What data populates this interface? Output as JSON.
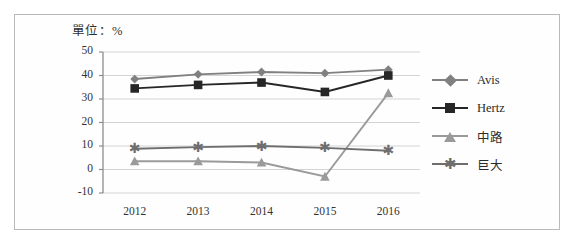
{
  "unit_label": "單位：%",
  "colors": {
    "avis": "#808080",
    "hertz": "#262626",
    "zhonglu": "#9a9a9a",
    "judai": "#6e6e6e",
    "grid": "#d4d4d4",
    "axis": "#8c8c8c",
    "frame": "#b9b9b9",
    "text": "#333333"
  },
  "legend": {
    "position": "right",
    "items": [
      {
        "label": "Avis",
        "marker": "diamond-marker",
        "color": "#808080"
      },
      {
        "label": "Hertz",
        "marker": "square-marker",
        "color": "#262626"
      },
      {
        "label": "中路",
        "marker": "triangle-marker",
        "color": "#9a9a9a"
      },
      {
        "label": "巨大",
        "marker": "star-marker",
        "color": "#6e6e6e"
      }
    ]
  },
  "chart_data": {
    "type": "line",
    "title": "",
    "subtitle": "",
    "xlabel": "",
    "ylabel": "",
    "unit": "%",
    "grid": true,
    "legend_position": "right",
    "categories": [
      "2012",
      "2013",
      "2014",
      "2015",
      "2016"
    ],
    "ylim": [
      -10,
      50
    ],
    "yticks": [
      -10,
      0,
      10,
      20,
      30,
      40,
      50
    ],
    "ytick_labels": [
      "-10",
      "0",
      "10",
      "20",
      "30",
      "40",
      "50"
    ],
    "series": [
      {
        "name": "Avis",
        "marker": "diamond",
        "color": "#808080",
        "values": [
          38.5,
          40.5,
          41.5,
          41.0,
          42.5
        ]
      },
      {
        "name": "Hertz",
        "marker": "square",
        "color": "#262626",
        "values": [
          34.5,
          36.0,
          37.0,
          33.0,
          40.0
        ]
      },
      {
        "name": "中路",
        "marker": "triangle",
        "color": "#9a9a9a",
        "values": [
          3.5,
          3.5,
          3.0,
          -3.0,
          32.5
        ]
      },
      {
        "name": "巨大",
        "marker": "star",
        "color": "#6e6e6e",
        "values": [
          8.8,
          9.5,
          10.0,
          9.2,
          8.0
        ]
      }
    ]
  }
}
